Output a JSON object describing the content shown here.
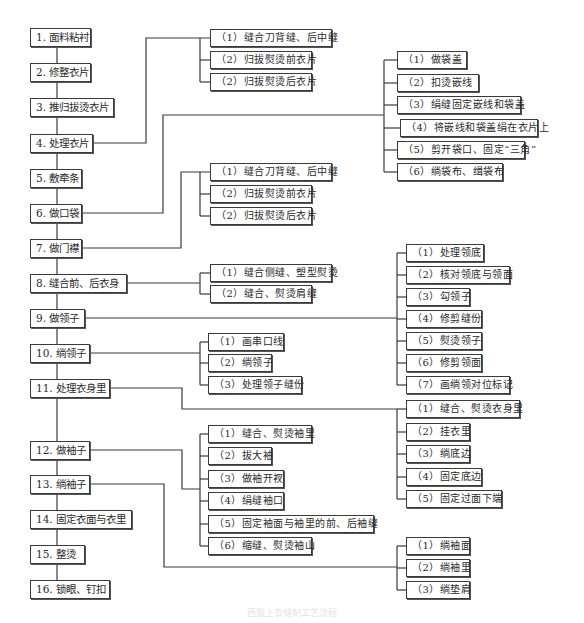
{
  "diagram": {
    "type": "process-flowchart",
    "main_steps": [
      {
        "id": 1,
        "label": "1. 面料粘衬"
      },
      {
        "id": 2,
        "label": "2. 修整衣片"
      },
      {
        "id": 3,
        "label": "3. 推归拔烫衣片"
      },
      {
        "id": 4,
        "label": "4. 处理衣片"
      },
      {
        "id": 5,
        "label": "5. 敷牵条"
      },
      {
        "id": 6,
        "label": "6. 做口袋"
      },
      {
        "id": 7,
        "label": "7. 做门襟"
      },
      {
        "id": 8,
        "label": "8. 缝合前、后衣身"
      },
      {
        "id": 9,
        "label": "9. 做领子"
      },
      {
        "id": 10,
        "label": "10. 绱领子"
      },
      {
        "id": 11,
        "label": "11. 处理衣身里"
      },
      {
        "id": 12,
        "label": "12. 做袖子"
      },
      {
        "id": 13,
        "label": "13. 绱袖子"
      },
      {
        "id": 14,
        "label": "14. 固定衣面与衣里"
      },
      {
        "id": 15,
        "label": "15. 整烫"
      },
      {
        "id": 16,
        "label": "16. 锁眼、钉扣"
      }
    ],
    "groups": {
      "step4": [
        "（1）缝合刀背缝、后中缝",
        "（2）归拔熨烫前衣片",
        "（2）归拔熨烫后衣片"
      ],
      "step6": [
        "（1）做袋盖",
        "（2）扣烫嵌线",
        "（3）绢缝固定嵌线和袋盖",
        "（4）将嵌线和袋盖绢在衣片上",
        "（5）剪开袋口、固定“三角”",
        "（6）绱袋布、缉袋布"
      ],
      "step7": [
        "（1）缝合刀背缝、后中缝",
        "（2）归拔熨烫前衣片",
        "（2）归拔熨烫后衣片"
      ],
      "step8": [
        "（1）缝合侧缝、塑型熨烫",
        "（2）缝合、熨烫肩缝"
      ],
      "step9": [
        "（1）处理领底",
        "（2）核对领底与领面",
        "（3）勾领子",
        "（4）修剪缝份",
        "（5）熨烫领子",
        "（6）修剪领面",
        "（7）画绱领对位标记"
      ],
      "step10": [
        "（1）画串口线",
        "（2）绱领子",
        "（3）处理领子缝份"
      ],
      "step11": [
        "（1）缝合、熨烫衣身里",
        "（2）挂衣里",
        "（3）绱底边",
        "（4）固定底边",
        "（5）固定过面下端"
      ],
      "step12": [
        "（1）缝合、熨烫袖里",
        "（2）拔大袖",
        "（3）做袖开衩",
        "（4）绢缝袖口",
        "（5）固定袖面与袖里的前、后袖缝",
        "（6）缩缝、熨烫袖山"
      ],
      "step13": [
        "（1）绱袖面",
        "（2）绱袖里",
        "（3）绱垫肩"
      ]
    },
    "caption": "西服上衣缝制工艺流程"
  }
}
